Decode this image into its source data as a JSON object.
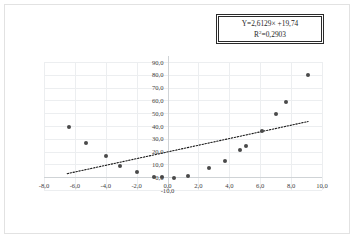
{
  "chart_data": {
    "type": "scatter",
    "title": "",
    "xlabel": "",
    "ylabel": "",
    "xlim": [
      -8.0,
      10.0
    ],
    "ylim": [
      -10.0,
      90.0
    ],
    "grid": true,
    "legend": false,
    "x_ticks": [
      "-8,0",
      "-6,0",
      "-4,0",
      "-2,0",
      "0,0",
      "2,0",
      "4,0",
      "6,0",
      "8,0",
      "10,0"
    ],
    "x_tick_values": [
      -8,
      -6,
      -4,
      -2,
      0,
      2,
      4,
      6,
      8,
      10
    ],
    "y_ticks": [
      "90,0",
      "80,0",
      "70,0",
      "60,0",
      "50,0",
      "40,0",
      "30,0",
      "20,0",
      "10,0",
      "0,0",
      "-10,0"
    ],
    "y_tick_values": [
      90,
      80,
      70,
      60,
      50,
      40,
      30,
      20,
      10,
      0,
      -10
    ],
    "points": [
      {
        "x": -6.4,
        "y": 39.5
      },
      {
        "x": -5.3,
        "y": 27.0
      },
      {
        "x": -4.0,
        "y": 16.5
      },
      {
        "x": -3.1,
        "y": 9.0
      },
      {
        "x": -2.0,
        "y": 4.0
      },
      {
        "x": -0.85,
        "y": 0.3
      },
      {
        "x": -0.35,
        "y": 0.3
      },
      {
        "x": 0.4,
        "y": -0.6
      },
      {
        "x": 1.3,
        "y": 1.3
      },
      {
        "x": 2.7,
        "y": 7.5
      },
      {
        "x": 3.7,
        "y": 12.5
      },
      {
        "x": 4.7,
        "y": 21.5
      },
      {
        "x": 5.05,
        "y": 24.5
      },
      {
        "x": 6.1,
        "y": 36.0
      },
      {
        "x": 7.0,
        "y": 49.0
      },
      {
        "x": 7.7,
        "y": 58.5
      },
      {
        "x": 9.1,
        "y": 80.0
      }
    ],
    "trendline": {
      "type": "linear",
      "style": "dotted",
      "slope": 2.6129,
      "intercept": 19.74,
      "x_start": -6.5,
      "x_end": 9.1
    },
    "annotations": {
      "equation": "Y=2,6129× +19,74",
      "r_squared_prefix": "R",
      "r_squared_sup": "2",
      "r_squared_value": "=0,2903"
    }
  },
  "style": {
    "point_color": "#4a4a4a",
    "trendline_color": "#1a1a1a",
    "grid_color": "#eceef0",
    "axis_color": "#cfd3d6",
    "frame_color": "#e2e2e2",
    "text_color": "#3f3f3f"
  }
}
